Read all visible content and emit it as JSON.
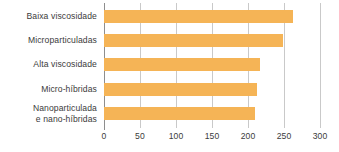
{
  "chart_data": {
    "type": "bar",
    "orientation": "horizontal",
    "title": "",
    "subtitle": "",
    "xlabel": "",
    "ylabel": "",
    "categories": [
      "Baixa viscosidade",
      "Microparticuladas",
      "Alta viscosidade",
      "Micro-híbridas",
      "Nanoparticulada\ne nano-híbridas"
    ],
    "values": [
      262,
      249,
      216,
      212,
      210
    ],
    "series": [
      {
        "name": "",
        "values": [
          262,
          249,
          216,
          212,
          210
        ]
      }
    ],
    "xlim": [
      0,
      300
    ],
    "xticks": [
      0,
      50,
      100,
      150,
      200,
      250,
      300
    ],
    "xtick_labels": [
      "0",
      "50",
      "100",
      "150",
      "200",
      "250",
      "300"
    ],
    "grid": "vertical",
    "legend": "none",
    "bar_color": "#f5b456",
    "gridline_color": "#c9c9c9",
    "axis_color": "#8e8e8e",
    "text_color": "#3b3b3b",
    "background_color": "#ffffff"
  }
}
